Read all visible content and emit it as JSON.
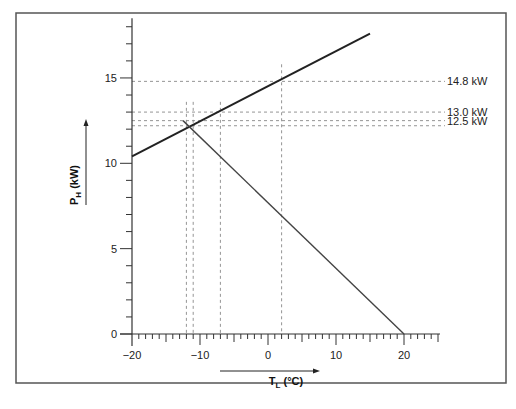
{
  "chart_data": {
    "type": "line",
    "title": "",
    "xlabel": "T_L (°C)",
    "xlabel_main": "T",
    "xlabel_sub": "L",
    "xlabel_unit": " (°C)",
    "ylabel": "P_H (kW)",
    "ylabel_main": "P",
    "ylabel_sub": "H",
    "ylabel_unit": " (kW)",
    "xlim": [
      -20,
      25
    ],
    "ylim": [
      0,
      18.5
    ],
    "x_ticks": [
      -20,
      -10,
      0,
      10,
      20
    ],
    "x_tick_labels": [
      "−20",
      "−10",
      "0",
      "10",
      "20"
    ],
    "y_ticks": [
      0,
      5,
      10,
      15
    ],
    "y_tick_labels": [
      "0",
      "5",
      "10",
      "15"
    ],
    "grid": false,
    "legend": null,
    "series": [
      {
        "name": "Heat pump heating capacity",
        "x": [
          -20,
          15
        ],
        "y": [
          10.4,
          17.6
        ]
      },
      {
        "name": "Building heat demand",
        "x": [
          -12.5,
          20
        ],
        "y": [
          12.5,
          0
        ]
      }
    ],
    "reference_lines": {
      "horizontal": [
        {
          "y": 14.8,
          "label": "14.8 kW"
        },
        {
          "y": 13.0,
          "label": "13.0 kW"
        },
        {
          "y": 12.5,
          "label": "12.5 kW"
        },
        {
          "y": 12.2,
          "label": ""
        }
      ],
      "vertical": [
        {
          "x": -12
        },
        {
          "x": -11
        },
        {
          "x": -7
        },
        {
          "x": 2
        }
      ]
    },
    "annotations": [
      "14.8 kW",
      "13.0 kW",
      "12.5 kW"
    ]
  }
}
